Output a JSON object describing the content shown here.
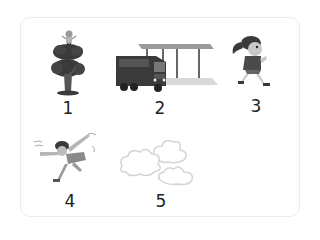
{
  "items": [
    {
      "number": "1",
      "subject": "child on top of tree",
      "icon": "tree-with-child-icon"
    },
    {
      "number": "2",
      "subject": "bus at bus stop shelter",
      "icon": "bus-stop-icon"
    },
    {
      "number": "3",
      "subject": "girl running",
      "icon": "running-girl-icon"
    },
    {
      "number": "4",
      "subject": "girl blown by wind",
      "icon": "windblown-girl-icon"
    },
    {
      "number": "5",
      "subject": "clouds / wind",
      "icon": "clouds-icon"
    }
  ],
  "colors": {
    "background": "#ffffff",
    "frame_border": "#ececec",
    "label_text": "#222222",
    "dark_fill": "#3a3a3a",
    "mid_fill": "#8a8a8a",
    "light_fill": "#cfcfcf"
  }
}
